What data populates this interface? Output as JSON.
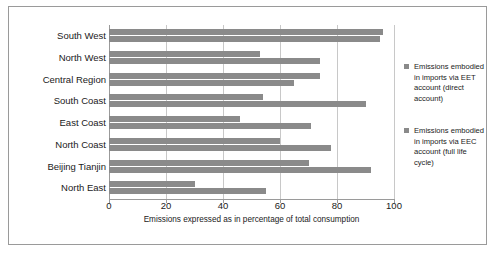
{
  "chart_data": {
    "type": "bar",
    "orientation": "horizontal",
    "title": "",
    "xlabel": "Emissions expressed as in percentage of total consumption",
    "ylabel": "",
    "xlim": [
      0,
      100
    ],
    "xticks": [
      0,
      20,
      40,
      60,
      80,
      100
    ],
    "grid": true,
    "legend_position": "right",
    "categories": [
      "South West",
      "North West",
      "Central Region",
      "South Coast",
      "East Coast",
      "North Coast",
      "Beijing Tianjin",
      "North East"
    ],
    "series": [
      {
        "name": "Emissions embodied in imports via EET account (direct account)",
        "color": "#8a8a8a",
        "values": [
          96,
          53,
          74,
          54,
          46,
          60,
          70,
          30
        ]
      },
      {
        "name": "Emissions embodied in imports via EEC account (full life cycle)",
        "color": "#8a8a8a",
        "values": [
          95,
          74,
          65,
          90,
          71,
          78,
          92,
          55
        ]
      }
    ]
  },
  "legend": {
    "entries": [
      "Emissions embodied in imports via EET account (direct account)",
      "Emissions embodied in imports via EEC account (full life cycle)"
    ]
  }
}
